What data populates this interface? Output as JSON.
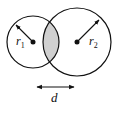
{
  "diagram": {
    "type": "two-intersecting-circles",
    "circle1": {
      "cx": 33,
      "cy": 42,
      "r": 26,
      "label": "r",
      "sub": "1"
    },
    "circle2": {
      "cx": 77,
      "cy": 42,
      "r": 34,
      "label": "r",
      "sub": "2"
    },
    "overlap_fill": "#d0d0d0",
    "distance": {
      "label": "d",
      "x1": 36,
      "x2": 75,
      "y": 87
    }
  }
}
